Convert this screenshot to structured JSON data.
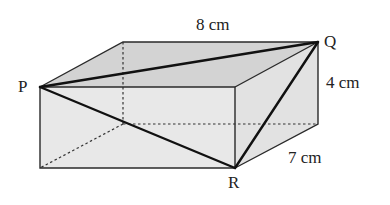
{
  "figure": {
    "type": "cuboid",
    "vertices": {
      "P": "P",
      "Q": "Q",
      "R": "R"
    },
    "dimensions": {
      "length": "8 cm",
      "height": "4 cm",
      "width": "7 cm"
    },
    "colors": {
      "top_face": "#d4d4d4",
      "side_face": "#e4e4e4",
      "front_face": "#e9e9e9",
      "edge": "#222222"
    }
  }
}
